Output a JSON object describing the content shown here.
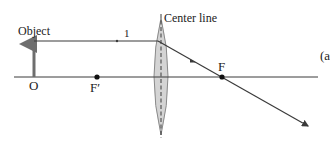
{
  "diagram": {
    "type": "converging-lens-ray-diagram",
    "labels": {
      "object": "Object",
      "ray_number": "1",
      "object_base": "O",
      "focal_point_near": "F′",
      "focal_point_far": "F",
      "center_line": "Center line",
      "part": "(a"
    },
    "elements": {
      "optical_axis": {
        "x1": 14,
        "y1": 77,
        "x2": 318,
        "y2": 77
      },
      "object_arrow": {
        "x": 34,
        "y_base": 77,
        "y_tip": 42
      },
      "lens": {
        "cx": 161,
        "top": 18,
        "bottom": 135,
        "half_width": 7
      },
      "center_line": {
        "x": 161,
        "y1": 14,
        "y2": 138
      },
      "ray_1": {
        "points": [
          [
            34,
            41
          ],
          [
            158,
            41
          ],
          [
            222,
            77
          ],
          [
            308,
            126
          ]
        ]
      },
      "focal_point_F_prime": {
        "x": 97,
        "y": 77
      },
      "focal_point_F": {
        "x": 222,
        "y": 77
      }
    },
    "colors": {
      "line": "#3a3a3a",
      "lens_fill": "#d4d4d4",
      "lens_stroke": "#8a8a8a",
      "object_arrow": "#6e6e6e",
      "text": "#222222"
    }
  }
}
